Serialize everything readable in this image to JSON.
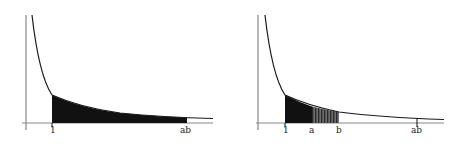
{
  "diagrams": [
    {
      "id": "left",
      "description": "Area under y=1/x from 1 to ab shaded solid",
      "labels": {
        "one": "1",
        "ab": "ab"
      },
      "shading": [
        {
          "from": "1",
          "to": "ab",
          "style": "solid"
        }
      ]
    },
    {
      "id": "right",
      "description": "Area under y=1/x from 1 to a solid, a to b hatched",
      "labels": {
        "one": "1",
        "a": "a",
        "b": "b",
        "ab": "ab"
      },
      "shading": [
        {
          "from": "1",
          "to": "a",
          "style": "solid"
        },
        {
          "from": "a",
          "to": "b",
          "style": "hatched"
        }
      ]
    }
  ],
  "colors": {
    "ink": "#1a1a1a",
    "axis": "#777777",
    "background": "#ffffff"
  }
}
